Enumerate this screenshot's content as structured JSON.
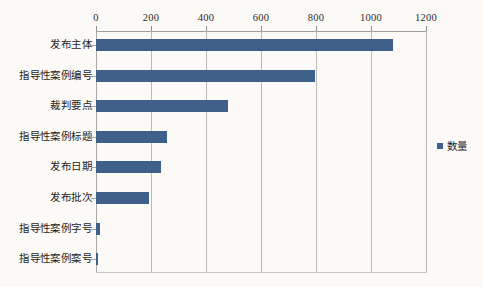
{
  "chart_data": {
    "type": "bar",
    "orientation": "horizontal",
    "title": "",
    "xlabel": "",
    "ylabel": "",
    "xlim": [
      0,
      1200
    ],
    "xticks": [
      0,
      200,
      400,
      600,
      800,
      1000,
      1200
    ],
    "xtick_labels": [
      "0",
      "200",
      "400",
      "600",
      "800",
      "1000",
      "1200"
    ],
    "grid": "vertical",
    "legend_position": "right",
    "categories": [
      "发布主体",
      "指导性案例编号",
      "裁判要点",
      "指导性案例标题",
      "发布日期",
      "发布批次",
      "指导性案例字号",
      "指导性案例案号"
    ],
    "series": [
      {
        "name": "数量",
        "color": "#40608C",
        "values": [
          1081,
          795,
          481,
          257,
          236,
          194,
          15,
          5
        ]
      }
    ]
  },
  "legend": {
    "entries": [
      {
        "label": "数量",
        "color": "#40608C",
        "marker": "square-marker"
      }
    ]
  },
  "colors": {
    "bar": "#40608C",
    "gridline": "#B9B9B9",
    "axis": "#9E9E9E",
    "background": "#FBFAF7",
    "text": "#1D1D1D"
  }
}
